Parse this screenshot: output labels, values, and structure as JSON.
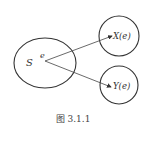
{
  "diagram": {
    "sample_space": {
      "label": "S",
      "point_label": "e"
    },
    "targets": [
      {
        "label": "X(e)"
      },
      {
        "label": "Y(e)"
      }
    ],
    "caption": "图 3.1.1",
    "colors": {
      "stroke": "#333333",
      "background": "#ffffff"
    }
  }
}
